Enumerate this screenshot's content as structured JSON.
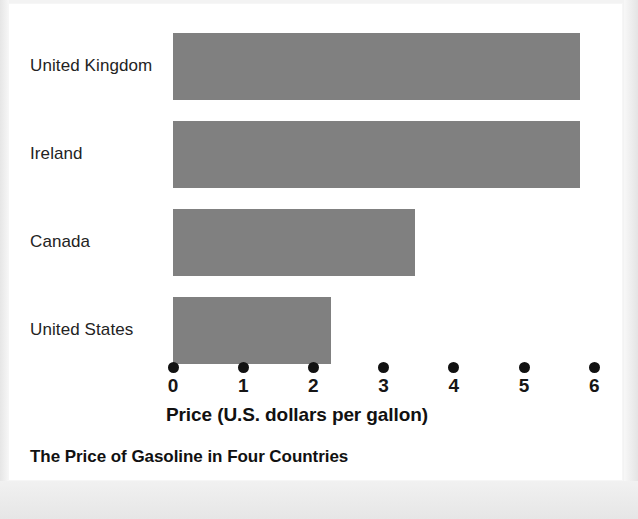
{
  "chart_data": {
    "type": "bar",
    "orientation": "horizontal",
    "title": "The Price of Gasoline in Four Countries",
    "xlabel": "Price (U.S. dollars per gallon)",
    "ylabel": "",
    "categories": [
      "United Kingdom",
      "Ireland",
      "Canada",
      "United States"
    ],
    "values": [
      5.8,
      5.8,
      3.45,
      2.25
    ],
    "xlim": [
      0,
      6
    ],
    "xticks": [
      0,
      1,
      2,
      3,
      4,
      5,
      6
    ],
    "xtick_labels": [
      "0",
      "1",
      "2",
      "3",
      "4",
      "5",
      "6"
    ],
    "grid": false,
    "legend": null,
    "bar_color": "#808080",
    "tick_marker": "filled-circle",
    "background_color": "#ffffff"
  },
  "chart": {
    "title": "The Price of Gasoline in Four Countries",
    "axis_title": "Price (U.S. dollars per gallon)",
    "bars": [
      {
        "label": "United Kingdom",
        "value": 5.8
      },
      {
        "label": "Ireland",
        "value": 5.8
      },
      {
        "label": "Canada",
        "value": 3.45
      },
      {
        "label": "United States",
        "value": 2.25
      }
    ],
    "ticks": [
      "0",
      "1",
      "2",
      "3",
      "4",
      "5",
      "6"
    ]
  },
  "colors": {
    "bar": "#808080",
    "text": "#111111",
    "label": "#232323",
    "page": "#ffffff"
  }
}
